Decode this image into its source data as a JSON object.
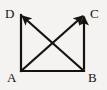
{
  "figure": {
    "kind": "geometry-diagram",
    "background_color": "#f4f3f1",
    "stroke_color": "#16130f",
    "label_color": "#16130f",
    "stroke_width": 2.2,
    "canvas": {
      "width": 107,
      "height": 90
    }
  },
  "vertices": [
    {
      "id": "A",
      "label": "A",
      "x": 21,
      "y": 71,
      "corner": "bottom-left"
    },
    {
      "id": "B",
      "label": "B",
      "x": 84,
      "y": 71,
      "corner": "bottom-right"
    },
    {
      "id": "C",
      "label": "C",
      "x": 84,
      "y": 15,
      "corner": "top-right"
    },
    {
      "id": "D",
      "label": "D",
      "x": 21,
      "y": 15,
      "corner": "top-left"
    }
  ],
  "edges": [
    {
      "id": "AD",
      "from": "A",
      "to": "D",
      "arrow": false,
      "role": "left-side"
    },
    {
      "id": "AB",
      "from": "A",
      "to": "B",
      "arrow": false,
      "role": "bottom-side"
    },
    {
      "id": "BC",
      "from": "B",
      "to": "C",
      "arrow": true,
      "role": "right-side-vector"
    },
    {
      "id": "AC",
      "from": "A",
      "to": "C",
      "arrow": true,
      "role": "diagonal-vector"
    },
    {
      "id": "BD",
      "from": "B",
      "to": "D",
      "arrow": true,
      "role": "diagonal-vector"
    }
  ]
}
